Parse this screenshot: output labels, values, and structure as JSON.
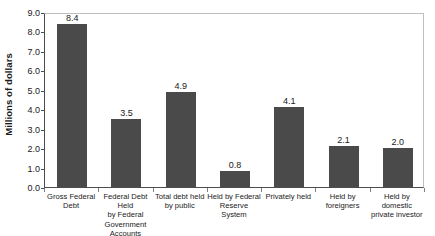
{
  "chart_data": {
    "type": "bar",
    "title": "",
    "xlabel": "",
    "ylabel": "Millions of dollars",
    "ylim": [
      0.0,
      9.0
    ],
    "ytick_step": 1.0,
    "grid": false,
    "legend": false,
    "bar_color": "#4a4a4a",
    "frame_color": "#bfbfbf",
    "axis_color": "#4d4d4d",
    "ytick_labels": [
      "9.0",
      "8.0",
      "7.0",
      "6.0",
      "5.0",
      "4.0",
      "3.0",
      "2.0",
      "1.0",
      "0.0"
    ],
    "ytick_values": [
      9.0,
      8.0,
      7.0,
      6.0,
      5.0,
      4.0,
      3.0,
      2.0,
      1.0,
      0.0
    ],
    "categories": [
      "Gross Federal Debt",
      "Federal Debt Held by Federal Government Accounts",
      "Total debt held by public",
      "Held by Federal Reserve System",
      "Privately held",
      "Held by foreigners",
      "Held by domestic private investor"
    ],
    "category_lines": [
      [
        "Gross Federal",
        "Debt"
      ],
      [
        "Federal Debt Held",
        "by Federal",
        "Government",
        "Accounts"
      ],
      [
        "Total debt held",
        "by public"
      ],
      [
        "Held by Federal",
        "Reserve System"
      ],
      [
        "Privately held"
      ],
      [
        "Held by",
        "foreigners"
      ],
      [
        "Held by domestic",
        "private investor"
      ]
    ],
    "values": [
      8.4,
      3.5,
      4.9,
      0.8,
      4.1,
      2.1,
      2.0
    ],
    "value_labels": [
      "8.4",
      "3.5",
      "4.9",
      "0.8",
      "4.1",
      "2.1",
      "2.0"
    ]
  }
}
